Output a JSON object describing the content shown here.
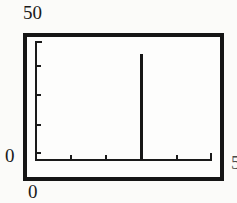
{
  "figure": {
    "labels": {
      "y_max": "50",
      "y_min": "0",
      "x_min": "0",
      "x_max_partial": "5"
    }
  },
  "chart_data": {
    "type": "bar",
    "title": "",
    "xlabel": "",
    "ylabel": "",
    "xlim": [
      0,
      50
    ],
    "ylim": [
      0,
      50
    ],
    "x_tick_interval": 10,
    "y_tick_interval": 10,
    "grid": false,
    "legend": "none",
    "series": [
      {
        "name": "spike",
        "x": 30,
        "value": 45
      }
    ],
    "visible_axis_labels": [
      "50",
      "0",
      "0",
      "5 (cut off at right edge)"
    ]
  },
  "colors": {
    "ink": "#1a1a1a",
    "frame": "#151515",
    "background": "#fbfbf9",
    "plot_background": "#fdfdfc"
  }
}
